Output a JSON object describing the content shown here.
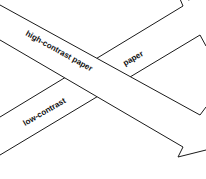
{
  "diagram": {
    "type": "crossing-arrows",
    "arrows": [
      {
        "id": "high-contrast",
        "direction": "down-right",
        "label": "high-contrast paper"
      },
      {
        "id": "low-contrast",
        "direction": "up-right",
        "label_part_1": "low-contrast",
        "label_part_2": "paper"
      }
    ],
    "colors": {
      "stroke": "#1a1a1a",
      "fill": "#ffffff",
      "text": "#111111"
    }
  }
}
